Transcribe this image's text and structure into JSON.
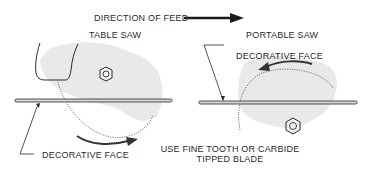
{
  "header": {
    "direction_label": "DIRECTION OF FEED"
  },
  "table_saw": {
    "title": "TABLE SAW",
    "face_label": "DECORATIVE FACE"
  },
  "portable_saw": {
    "title": "PORTABLE SAW",
    "face_label": "DECORATIVE FACE"
  },
  "note": {
    "line1": "USE FINE TOOTH OR CARBIDE",
    "line2": "TIPPED BLADE"
  },
  "colors": {
    "ink": "#2a2a2a",
    "shade": "#e9e9e9"
  }
}
